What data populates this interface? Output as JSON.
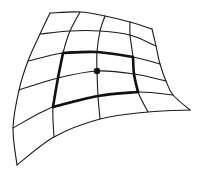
{
  "diagram": {
    "colors": {
      "background": "#ffffff",
      "stroke": "#1a1a1a",
      "point": "#111111"
    },
    "grid_rows": [
      [
        [
          50,
          13
        ],
        [
          80,
          12
        ],
        [
          105,
          16
        ],
        [
          130,
          22
        ],
        [
          152,
          29
        ]
      ],
      [
        [
          40,
          34
        ],
        [
          70,
          31
        ],
        [
          100,
          31
        ],
        [
          130,
          35
        ],
        [
          156,
          46
        ]
      ],
      [
        [
          28,
          61
        ],
        [
          63,
          53
        ],
        [
          97,
          52
        ],
        [
          133,
          57
        ],
        [
          160,
          64
        ]
      ],
      [
        [
          19,
          90
        ],
        [
          58,
          78
        ],
        [
          97,
          71
        ],
        [
          134,
          74
        ],
        [
          166,
          81
        ]
      ],
      [
        [
          13,
          128
        ],
        [
          53,
          107
        ],
        [
          98,
          96
        ],
        [
          138,
          92
        ],
        [
          173,
          95
        ]
      ],
      [
        [
          17,
          165
        ],
        [
          54,
          137
        ],
        [
          100,
          119
        ],
        [
          148,
          112
        ],
        [
          190,
          110
        ]
      ]
    ],
    "highlight_patch": {
      "row_start": 2,
      "row_end": 4,
      "col_start": 1,
      "col_end": 3
    },
    "center_point": [
      97,
      71
    ]
  }
}
